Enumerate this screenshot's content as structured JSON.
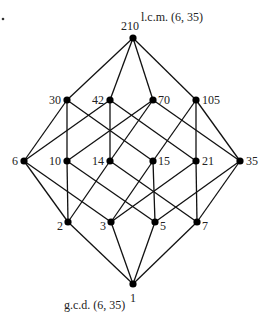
{
  "diagram": {
    "annotations": {
      "top": "l.c.m. (6, 35)",
      "bottom": "g.c.d. (6, 35)"
    },
    "nodes": [
      {
        "id": "210",
        "x": 133,
        "y": 38,
        "lx": 121,
        "ly": 30,
        "anchor": "start"
      },
      {
        "id": "30",
        "x": 67,
        "y": 100,
        "lx": 61,
        "ly": 104,
        "anchor": "end"
      },
      {
        "id": "42",
        "x": 110,
        "y": 100,
        "lx": 104,
        "ly": 104,
        "anchor": "end"
      },
      {
        "id": "70",
        "x": 153,
        "y": 100,
        "lx": 158,
        "ly": 104,
        "anchor": "start"
      },
      {
        "id": "105",
        "x": 196,
        "y": 100,
        "lx": 202,
        "ly": 104,
        "anchor": "start"
      },
      {
        "id": "6",
        "x": 24,
        "y": 161,
        "lx": 18,
        "ly": 165,
        "anchor": "end"
      },
      {
        "id": "10",
        "x": 67,
        "y": 161,
        "lx": 61,
        "ly": 165,
        "anchor": "end"
      },
      {
        "id": "14",
        "x": 110,
        "y": 161,
        "lx": 104,
        "ly": 165,
        "anchor": "end"
      },
      {
        "id": "15",
        "x": 153,
        "y": 161,
        "lx": 158,
        "ly": 165,
        "anchor": "start"
      },
      {
        "id": "21",
        "x": 196,
        "y": 161,
        "lx": 202,
        "ly": 165,
        "anchor": "start"
      },
      {
        "id": "35",
        "x": 240,
        "y": 161,
        "lx": 246,
        "ly": 165,
        "anchor": "start"
      },
      {
        "id": "2",
        "x": 68,
        "y": 222,
        "lx": 63,
        "ly": 230,
        "anchor": "end"
      },
      {
        "id": "3",
        "x": 111,
        "y": 222,
        "lx": 106,
        "ly": 230,
        "anchor": "end"
      },
      {
        "id": "5",
        "x": 155,
        "y": 222,
        "lx": 160,
        "ly": 230,
        "anchor": "start"
      },
      {
        "id": "7",
        "x": 197,
        "y": 222,
        "lx": 202,
        "ly": 230,
        "anchor": "start"
      },
      {
        "id": "1",
        "x": 133,
        "y": 284,
        "lx": 130,
        "ly": 302,
        "anchor": "start"
      }
    ],
    "edges": [
      [
        "210",
        "30"
      ],
      [
        "210",
        "42"
      ],
      [
        "210",
        "70"
      ],
      [
        "210",
        "105"
      ],
      [
        "30",
        "6"
      ],
      [
        "30",
        "10"
      ],
      [
        "30",
        "15"
      ],
      [
        "42",
        "6"
      ],
      [
        "42",
        "14"
      ],
      [
        "42",
        "21"
      ],
      [
        "70",
        "10"
      ],
      [
        "70",
        "14"
      ],
      [
        "70",
        "35"
      ],
      [
        "105",
        "15"
      ],
      [
        "105",
        "21"
      ],
      [
        "105",
        "35"
      ],
      [
        "6",
        "2"
      ],
      [
        "6",
        "3"
      ],
      [
        "10",
        "2"
      ],
      [
        "10",
        "5"
      ],
      [
        "14",
        "2"
      ],
      [
        "14",
        "7"
      ],
      [
        "15",
        "3"
      ],
      [
        "15",
        "5"
      ],
      [
        "21",
        "3"
      ],
      [
        "21",
        "7"
      ],
      [
        "35",
        "5"
      ],
      [
        "35",
        "7"
      ],
      [
        "2",
        "1"
      ],
      [
        "3",
        "1"
      ],
      [
        "5",
        "1"
      ],
      [
        "7",
        "1"
      ]
    ]
  }
}
